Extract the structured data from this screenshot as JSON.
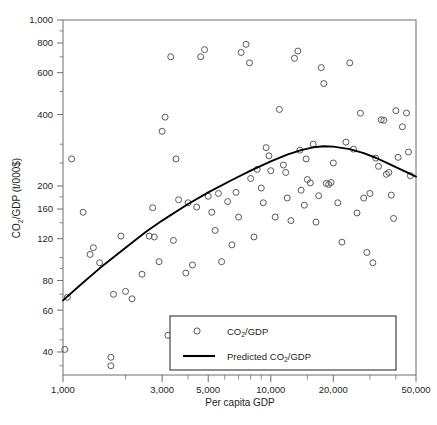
{
  "chart_data": {
    "type": "scatter",
    "title": "",
    "xlabel": "Per capita GDP",
    "ylabel": "CO2/GDP (t/000$)",
    "ylabel_parts": {
      "pre": "CO",
      "sub": "2",
      "post": "/GDP (t/000$)"
    },
    "xscale": "log",
    "yscale": "log",
    "xlim": [
      1000,
      50000
    ],
    "ylim": [
      32,
      1000
    ],
    "grid": false,
    "x_ticklabels": [
      "1,000",
      "3,000",
      "5,000",
      "10,000",
      "20,000",
      "50,000"
    ],
    "x_tickvalues": [
      1000,
      3000,
      5000,
      10000,
      20000,
      50000
    ],
    "y_ticklabels": [
      "1,000",
      "800",
      "600",
      "400",
      "200",
      "160",
      "120",
      "80",
      "60",
      "40"
    ],
    "y_tickvalues": [
      1000,
      800,
      600,
      400,
      200,
      160,
      120,
      80,
      60,
      40
    ],
    "legend_position": "bottom-center-inside",
    "series": [
      {
        "name": "CO2/GDP",
        "label_parts": {
          "pre": "CO",
          "sub": "2",
          "post": "/GDP"
        },
        "type": "scatter",
        "marker": "open-circle",
        "color": "#58595b",
        "points": [
          [
            1020,
            41
          ],
          [
            1050,
            68
          ],
          [
            1100,
            260
          ],
          [
            1250,
            155
          ],
          [
            1350,
            103
          ],
          [
            1400,
            110
          ],
          [
            1500,
            95
          ],
          [
            1700,
            38
          ],
          [
            1700,
            35
          ],
          [
            1750,
            70
          ],
          [
            1900,
            123
          ],
          [
            2000,
            72
          ],
          [
            2150,
            67
          ],
          [
            2400,
            85
          ],
          [
            2600,
            123
          ],
          [
            2700,
            162
          ],
          [
            2750,
            122
          ],
          [
            2900,
            96
          ],
          [
            3000,
            340
          ],
          [
            3100,
            390
          ],
          [
            3200,
            47
          ],
          [
            3300,
            700
          ],
          [
            3400,
            118
          ],
          [
            3500,
            260
          ],
          [
            3600,
            175
          ],
          [
            3900,
            86
          ],
          [
            4000,
            170
          ],
          [
            4200,
            93
          ],
          [
            4400,
            163
          ],
          [
            4600,
            700
          ],
          [
            4800,
            750
          ],
          [
            5000,
            181
          ],
          [
            5200,
            155
          ],
          [
            5400,
            130
          ],
          [
            5600,
            186
          ],
          [
            5800,
            96
          ],
          [
            6200,
            172
          ],
          [
            6500,
            113
          ],
          [
            6800,
            188
          ],
          [
            7000,
            148
          ],
          [
            7200,
            730
          ],
          [
            7600,
            790
          ],
          [
            7900,
            660
          ],
          [
            8000,
            215
          ],
          [
            8300,
            122
          ],
          [
            8600,
            235
          ],
          [
            9000,
            196
          ],
          [
            9200,
            170
          ],
          [
            9500,
            290
          ],
          [
            9800,
            268
          ],
          [
            10000,
            232
          ],
          [
            10500,
            148
          ],
          [
            11000,
            420
          ],
          [
            11500,
            245
          ],
          [
            11800,
            228
          ],
          [
            12000,
            178
          ],
          [
            12500,
            143
          ],
          [
            13000,
            690
          ],
          [
            13500,
            740
          ],
          [
            13800,
            283
          ],
          [
            14000,
            192
          ],
          [
            14500,
            166
          ],
          [
            14800,
            260
          ],
          [
            15000,
            213
          ],
          [
            15500,
            206
          ],
          [
            16000,
            300
          ],
          [
            16500,
            141
          ],
          [
            17000,
            182
          ],
          [
            17500,
            630
          ],
          [
            18000,
            540
          ],
          [
            18500,
            205
          ],
          [
            19000,
            203
          ],
          [
            19500,
            207
          ],
          [
            20000,
            250
          ],
          [
            21000,
            170
          ],
          [
            22000,
            116
          ],
          [
            23000,
            306
          ],
          [
            24000,
            660
          ],
          [
            25000,
            286
          ],
          [
            26000,
            154
          ],
          [
            27000,
            405
          ],
          [
            28000,
            178
          ],
          [
            29000,
            105
          ],
          [
            30000,
            186
          ],
          [
            31000,
            95
          ],
          [
            32000,
            262
          ],
          [
            33000,
            242
          ],
          [
            34000,
            380
          ],
          [
            35000,
            378
          ],
          [
            36000,
            224
          ],
          [
            37000,
            228
          ],
          [
            38000,
            183
          ],
          [
            39000,
            146
          ],
          [
            40000,
            415
          ],
          [
            41000,
            264
          ],
          [
            43000,
            355
          ],
          [
            45000,
            406
          ],
          [
            46000,
            278
          ],
          [
            47000,
            221
          ]
        ]
      },
      {
        "name": "Predicted CO2/GDP",
        "label_parts": {
          "pre": "Predicted CO",
          "sub": "2",
          "post": "/GDP"
        },
        "type": "line",
        "color": "#000000",
        "points": [
          [
            1000,
            66
          ],
          [
            1200,
            76
          ],
          [
            1500,
            90
          ],
          [
            2000,
            110
          ],
          [
            2500,
            128
          ],
          [
            3000,
            143
          ],
          [
            4000,
            168
          ],
          [
            5000,
            188
          ],
          [
            6500,
            212
          ],
          [
            8000,
            232
          ],
          [
            10000,
            254
          ],
          [
            12000,
            271
          ],
          [
            14000,
            283
          ],
          [
            16000,
            291
          ],
          [
            18000,
            294
          ],
          [
            20000,
            293
          ],
          [
            24000,
            286
          ],
          [
            28000,
            275
          ],
          [
            32000,
            263
          ],
          [
            36000,
            251
          ],
          [
            40000,
            240
          ],
          [
            45000,
            229
          ],
          [
            50000,
            219
          ]
        ]
      }
    ]
  },
  "legend": {
    "scatter_label": "CO2/GDP",
    "line_label": "Predicted CO2/GDP"
  },
  "axes": {
    "x_title": "Per capita GDP",
    "y_title": "CO2/GDP (t/000$)"
  }
}
